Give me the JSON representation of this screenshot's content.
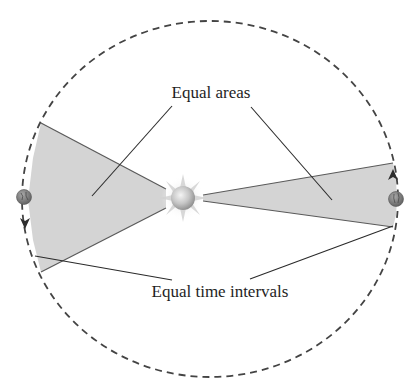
{
  "diagram": {
    "labels": {
      "equal_areas": "Equal areas",
      "equal_time_intervals": "Equal time intervals"
    },
    "elements": {
      "orbit": "elliptical-orbit-dashed",
      "star": "sun-icon",
      "planets": [
        "planet-left-icon",
        "planet-right-icon"
      ],
      "wedges": [
        "swept-area-left",
        "swept-area-right"
      ],
      "direction_arrows": [
        "arrow-down-left",
        "arrow-up-right"
      ]
    },
    "colors": {
      "orbit_stroke": "#444444",
      "wedge_fill": "#d4d4d4",
      "wedge_stroke": "#5a5a5a",
      "leader_line": "#2a2a2a",
      "sun_core": "#c8c8c8",
      "planet": "#7a7a7a"
    }
  }
}
